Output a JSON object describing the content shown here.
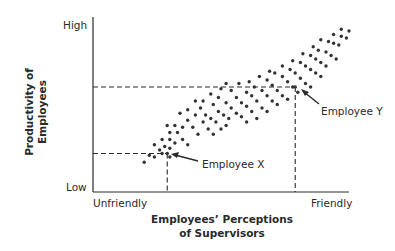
{
  "chart_data": {
    "type": "scatter",
    "title": "",
    "xlabel": "Employees’ Perceptions of Supervisors",
    "xlabel_lines": [
      "Employees’ Perceptions",
      "of Supervisors"
    ],
    "ylabel": "Productivity of Employees",
    "ylabel_lines": [
      "Productivity of",
      "Employees"
    ],
    "x_tick_labels": {
      "min": "Unfriendly",
      "max": "Friendly"
    },
    "y_tick_labels": {
      "min": "Low",
      "max": "High"
    },
    "xlim": [
      0,
      100
    ],
    "ylim": [
      0,
      100
    ],
    "grid": false,
    "legend": null,
    "trend": "positive correlation",
    "series": [
      {
        "name": "Employees",
        "points": [
          [
            20,
            17
          ],
          [
            22,
            21
          ],
          [
            24,
            20
          ],
          [
            26,
            24
          ],
          [
            27,
            22
          ],
          [
            28,
            26
          ],
          [
            30,
            20
          ],
          [
            30,
            25
          ],
          [
            24,
            27
          ],
          [
            27,
            30
          ],
          [
            30,
            30
          ],
          [
            32,
            28
          ],
          [
            33,
            34
          ],
          [
            35,
            30
          ],
          [
            37,
            27
          ],
          [
            30,
            34
          ],
          [
            29,
            38
          ],
          [
            32,
            38
          ],
          [
            35,
            37
          ],
          [
            37,
            41
          ],
          [
            39,
            37
          ],
          [
            41,
            33
          ],
          [
            40,
            44
          ],
          [
            43,
            40
          ],
          [
            45,
            36
          ],
          [
            47,
            33
          ],
          [
            34,
            45
          ],
          [
            37,
            47
          ],
          [
            42,
            48
          ],
          [
            44,
            44
          ],
          [
            46,
            42
          ],
          [
            48,
            40
          ],
          [
            50,
            36
          ],
          [
            52,
            38
          ],
          [
            40,
            52
          ],
          [
            43,
            52
          ],
          [
            47,
            50
          ],
          [
            49,
            46
          ],
          [
            51,
            44
          ],
          [
            53,
            42
          ],
          [
            46,
            56
          ],
          [
            49,
            54
          ],
          [
            52,
            51
          ],
          [
            54,
            48
          ],
          [
            56,
            45
          ],
          [
            58,
            43
          ],
          [
            60,
            40
          ],
          [
            50,
            59
          ],
          [
            54,
            58
          ],
          [
            56,
            54
          ],
          [
            58,
            51
          ],
          [
            60,
            49
          ],
          [
            62,
            46
          ],
          [
            64,
            42
          ],
          [
            52,
            62
          ],
          [
            57,
            62
          ],
          [
            60,
            57
          ],
          [
            62,
            55
          ],
          [
            64,
            52
          ],
          [
            66,
            48
          ],
          [
            68,
            46
          ],
          [
            61,
            63
          ],
          [
            63,
            60
          ],
          [
            66,
            58
          ],
          [
            68,
            55
          ],
          [
            70,
            52
          ],
          [
            72,
            50
          ],
          [
            65,
            66
          ],
          [
            68,
            64
          ],
          [
            70,
            61
          ],
          [
            72,
            58
          ],
          [
            74,
            55
          ],
          [
            76,
            53
          ],
          [
            69,
            69
          ],
          [
            71,
            68
          ],
          [
            74,
            66
          ],
          [
            76,
            63
          ],
          [
            78,
            60
          ],
          [
            80,
            57
          ],
          [
            74,
            72
          ],
          [
            77,
            70
          ],
          [
            79,
            68
          ],
          [
            81,
            65
          ],
          [
            83,
            62
          ],
          [
            85,
            60
          ],
          [
            78,
            75
          ],
          [
            81,
            74
          ],
          [
            83,
            72
          ],
          [
            85,
            70
          ],
          [
            87,
            68
          ],
          [
            89,
            66
          ],
          [
            82,
            79
          ],
          [
            85,
            78
          ],
          [
            87,
            76
          ],
          [
            89,
            74
          ],
          [
            91,
            72
          ],
          [
            86,
            83
          ],
          [
            88,
            81
          ],
          [
            91,
            80
          ],
          [
            93,
            78
          ],
          [
            95,
            76
          ],
          [
            89,
            87
          ],
          [
            92,
            86
          ],
          [
            94,
            85
          ],
          [
            96,
            84
          ],
          [
            94,
            90
          ],
          [
            97,
            89
          ],
          [
            99,
            88
          ],
          [
            97,
            93
          ],
          [
            100,
            92
          ]
        ]
      }
    ],
    "annotations": [
      {
        "text": "Employee X",
        "point": [
          29,
          22
        ]
      },
      {
        "text": "Employee Y",
        "point": [
          79,
          60
        ]
      }
    ]
  },
  "labels": {
    "y_high": "High",
    "y_low": "Low",
    "x_low": "Unfriendly",
    "x_high": "Friendly",
    "employee_x": "Employee X",
    "employee_y": "Employee Y",
    "ylabel_line1": "Productivity of",
    "ylabel_line2": "Employees",
    "xlabel_line1": "Employees’ Perceptions",
    "xlabel_line2": "of Supervisors"
  },
  "colors": {
    "ink": "#2a2a2a",
    "dot": "#333333",
    "background": "#ffffff"
  }
}
